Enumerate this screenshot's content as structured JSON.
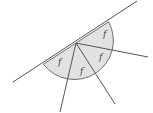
{
  "diagram": {
    "colors": {
      "fill": "#e2e2e2",
      "stroke": "#707070",
      "label": "#444444"
    },
    "center": [
      76,
      43
    ],
    "radius": 39,
    "line": {
      "from": [
        13,
        82
      ],
      "to": [
        137,
        1
      ]
    },
    "rays": [
      {
        "to": [
          148,
          57
        ]
      },
      {
        "to": [
          115,
          104
        ]
      },
      {
        "to": [
          60,
          112
        ]
      }
    ],
    "sectors": [
      {
        "label": "f",
        "pos": [
          103,
          37
        ]
      },
      {
        "label": "f",
        "pos": [
          99,
          60
        ]
      },
      {
        "label": "f",
        "pos": [
          80,
          74
        ]
      },
      {
        "label": "f",
        "pos": [
          58,
          65
        ]
      }
    ]
  }
}
